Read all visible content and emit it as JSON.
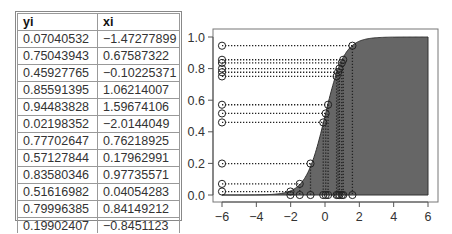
{
  "table": {
    "headers": [
      "yi",
      "xi"
    ],
    "rows": [
      [
        "0.07040532",
        "−1.47277899"
      ],
      [
        "0.75043943",
        "0.67587322"
      ],
      [
        "0.45927765",
        "−0.10225371"
      ],
      [
        "0.85591395",
        "1.06214007"
      ],
      [
        "0.94483828",
        "1.59674106"
      ],
      [
        "0.02198352",
        "−2.0144049"
      ],
      [
        "0.77702647",
        "0.76218925"
      ],
      [
        "0.57127844",
        "0.17962991"
      ],
      [
        "0.83580346",
        "0.97735571"
      ],
      [
        "0.51616982",
        "0.04054283"
      ],
      [
        "0.79996385",
        "0.84149212"
      ],
      [
        "0.19902407",
        "−0.8451123"
      ]
    ]
  },
  "chart_data": {
    "type": "area",
    "title": "",
    "xlabel": "",
    "ylabel": "",
    "curve": {
      "function": "logistic",
      "scale": 1.8,
      "x_range": [
        -6,
        6
      ]
    },
    "xlim": [
      -6,
      6
    ],
    "ylim": [
      0,
      1
    ],
    "x_ticks": [
      -6,
      -4,
      -2,
      0,
      2,
      4,
      6
    ],
    "x_tick_labels": [
      "−6",
      "−4",
      "−2",
      "0",
      "2",
      "4",
      "6"
    ],
    "y_ticks": [
      0,
      0.2,
      0.4,
      0.6,
      0.8,
      1.0
    ],
    "y_tick_labels": [
      "0.0",
      "0.2",
      "0.4",
      "0.6",
      "0.8",
      "1.0"
    ],
    "grid": false,
    "legend": null,
    "fill_color": "#666666",
    "line_color": "#333333",
    "points": [
      {
        "x": -1.47277899,
        "y": 0.07040532
      },
      {
        "x": 0.67587322,
        "y": 0.75043943
      },
      {
        "x": -0.10225371,
        "y": 0.45927765
      },
      {
        "x": 1.06214007,
        "y": 0.85591395
      },
      {
        "x": 1.59674106,
        "y": 0.94483828
      },
      {
        "x": -2.0144049,
        "y": 0.02198352
      },
      {
        "x": 0.76218925,
        "y": 0.77702647
      },
      {
        "x": 0.17962991,
        "y": 0.57127844
      },
      {
        "x": 0.97735571,
        "y": 0.83580346
      },
      {
        "x": 0.04054283,
        "y": 0.51616982
      },
      {
        "x": 0.84149212,
        "y": 0.79996385
      },
      {
        "x": -0.8451123,
        "y": 0.19902407
      }
    ]
  }
}
